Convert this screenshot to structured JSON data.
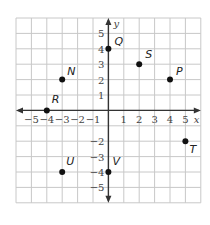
{
  "diagram": {
    "type": "coordinate-plane",
    "grid": {
      "xmin": -6,
      "xmax": 6,
      "ymin": -6,
      "ymax": 6,
      "color": "#c8c8c8"
    },
    "axes": {
      "x_label": "x",
      "y_label": "y",
      "x_ticks": [
        "-5",
        "-4",
        "-3",
        "-2",
        "-1",
        "1",
        "2",
        "3",
        "4",
        "5"
      ],
      "x_tick_values": [
        -5,
        -4,
        -3,
        -2,
        -1,
        1,
        2,
        3,
        4,
        5
      ],
      "y_ticks": [
        "5",
        "4",
        "3",
        "2",
        "1",
        "-2",
        "-3",
        "-4",
        "-5"
      ],
      "y_tick_values": [
        5,
        4,
        3,
        2,
        1,
        -2,
        -3,
        -4,
        -5
      ],
      "color": "#333333"
    },
    "points": [
      {
        "label": "Q",
        "x": 0,
        "y": 4,
        "lx": 6,
        "ly": -4
      },
      {
        "label": "S",
        "x": 2,
        "y": 3,
        "lx": 6,
        "ly": -6
      },
      {
        "label": "N",
        "x": -3,
        "y": 2,
        "lx": 5,
        "ly": -5
      },
      {
        "label": "P",
        "x": 4,
        "y": 2,
        "lx": 6,
        "ly": -5
      },
      {
        "label": "R",
        "x": -4,
        "y": 0,
        "lx": 5,
        "ly": -7
      },
      {
        "label": "T",
        "x": 5,
        "y": -2,
        "lx": 4,
        "ly": 12
      },
      {
        "label": "U",
        "x": -3,
        "y": -4,
        "lx": 4,
        "ly": -7
      },
      {
        "label": "V",
        "x": 0,
        "y": -4,
        "lx": 4,
        "ly": -7
      }
    ]
  }
}
